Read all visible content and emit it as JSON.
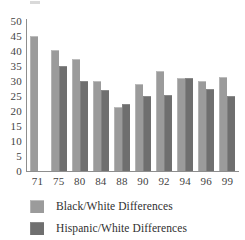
{
  "chart_data": {
    "type": "bar",
    "title": "",
    "subtitle": "",
    "xlabel": "",
    "ylabel": "",
    "ylim": [
      0,
      50
    ],
    "yticks": [
      50,
      45,
      40,
      35,
      30,
      25,
      20,
      15,
      10,
      5,
      0
    ],
    "grid": false,
    "legend_position": "bottom-left",
    "categories": [
      "71",
      "75",
      "80",
      "84",
      "88",
      "90",
      "92",
      "94",
      "96",
      "99"
    ],
    "series": [
      {
        "name": "Black/White Differences",
        "color": "#9b9b9b",
        "values": [
          45,
          40.5,
          37.5,
          30,
          21.5,
          29,
          33.5,
          31,
          30,
          31.5
        ]
      },
      {
        "name": "Hispanic/White Differences",
        "color": "#6f6f6f",
        "values": [
          null,
          35,
          30,
          27,
          22.5,
          25,
          25.5,
          31,
          27.5,
          25
        ]
      }
    ]
  },
  "legend": {
    "items": [
      {
        "label": "Black/White Differences",
        "swatch": "black"
      },
      {
        "label": "Hispanic/White Differences",
        "swatch": "hisp"
      }
    ]
  }
}
